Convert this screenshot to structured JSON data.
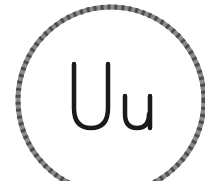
{
  "card": {
    "letters": "Uu",
    "upper": "U",
    "lower": "u"
  },
  "colors": {
    "ring": "#777777",
    "ring_dash": "#555555",
    "text": "#1a1a1a",
    "background": "#ffffff"
  }
}
